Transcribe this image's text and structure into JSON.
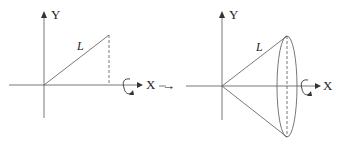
{
  "diagram": {
    "left_panel": {
      "y_axis_label": "Y",
      "x_axis_label": "X",
      "segment_label": "L",
      "rotation_icon": "rotation-arrow-icon"
    },
    "transition_arrow": "→",
    "right_panel": {
      "y_axis_label": "Y",
      "x_axis_label": "X",
      "segment_label": "L",
      "rotation_icon": "rotation-arrow-icon"
    },
    "colors": {
      "line": "#333333",
      "background": "#ffffff"
    }
  }
}
